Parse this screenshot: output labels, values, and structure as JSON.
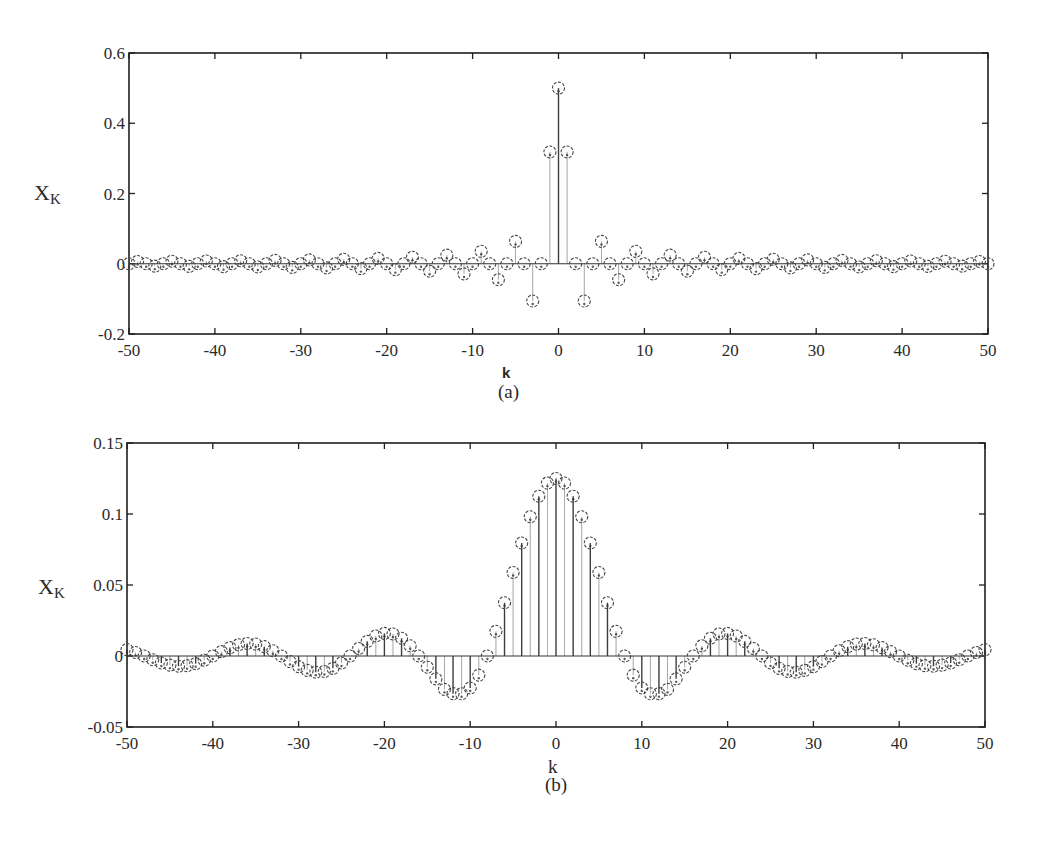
{
  "chart_data": [
    {
      "id": "a",
      "type": "stem",
      "caption": "(a)",
      "title": "",
      "xlabel": "k",
      "ylabel": "X",
      "ylabel_sub": "K",
      "xlim": [
        -50,
        50
      ],
      "ylim": [
        -0.2,
        0.6
      ],
      "xticks": [
        -50,
        -40,
        -30,
        -20,
        -10,
        0,
        10,
        20,
        30,
        40,
        50
      ],
      "xtick_labels": [
        "-50",
        "-40",
        "-30",
        "-20",
        "-10",
        "0",
        "10",
        "20",
        "30",
        "40",
        "50"
      ],
      "yticks": [
        -0.2,
        0,
        0.2,
        0.4,
        0.6
      ],
      "ytick_labels": [
        "-0.2",
        "0",
        "0.2",
        "0.4",
        "0.6"
      ],
      "grid": false,
      "legend": null,
      "marker": "circle",
      "x": [
        -50,
        -49,
        -48,
        -47,
        -46,
        -45,
        -44,
        -43,
        -42,
        -41,
        -40,
        -39,
        -38,
        -37,
        -36,
        -35,
        -34,
        -33,
        -32,
        -31,
        -30,
        -29,
        -28,
        -27,
        -26,
        -25,
        -24,
        -23,
        -22,
        -21,
        -20,
        -19,
        -18,
        -17,
        -16,
        -15,
        -14,
        -13,
        -12,
        -11,
        -10,
        -9,
        -8,
        -7,
        -6,
        -5,
        -4,
        -3,
        -2,
        -1,
        0,
        1,
        2,
        3,
        4,
        5,
        6,
        7,
        8,
        9,
        10,
        11,
        12,
        13,
        14,
        15,
        16,
        17,
        18,
        19,
        20,
        21,
        22,
        23,
        24,
        25,
        26,
        27,
        28,
        29,
        30,
        31,
        32,
        33,
        34,
        35,
        36,
        37,
        38,
        39,
        40,
        41,
        42,
        43,
        44,
        45,
        46,
        47,
        48,
        49,
        50
      ],
      "values": [
        0,
        0.0065,
        0,
        -0.0068,
        0,
        0.0071,
        0,
        -0.0074,
        0,
        0.0078,
        0,
        -0.0082,
        0,
        0.0086,
        0,
        -0.0091,
        0,
        0.0096,
        0,
        -0.0103,
        0,
        0.011,
        0,
        -0.0118,
        0,
        0.0127,
        0,
        -0.0138,
        0,
        0.0152,
        0,
        -0.0168,
        0,
        0.0187,
        0,
        -0.0212,
        0,
        0.0245,
        0,
        -0.0289,
        0,
        0.0354,
        0,
        -0.0455,
        0,
        0.0637,
        0,
        -0.1061,
        0,
        0.3183,
        0.5,
        0.3183,
        0,
        -0.1061,
        0,
        0.0637,
        0,
        -0.0455,
        0,
        0.0354,
        0,
        -0.0289,
        0,
        0.0245,
        0,
        -0.0212,
        0,
        0.0187,
        0,
        -0.0168,
        0,
        0.0152,
        0,
        -0.0138,
        0,
        0.0127,
        0,
        -0.0118,
        0,
        0.011,
        0,
        -0.0103,
        0,
        0.0096,
        0,
        -0.0091,
        0,
        0.0086,
        0,
        -0.0082,
        0,
        0.0078,
        0,
        -0.0074,
        0,
        0.0071,
        0,
        -0.0068,
        0,
        0.0065,
        0
      ]
    },
    {
      "id": "b",
      "type": "stem",
      "caption": "(b)",
      "title": "",
      "xlabel": "k",
      "ylabel": "X",
      "ylabel_sub": "K",
      "xlim": [
        -50,
        50
      ],
      "ylim": [
        -0.05,
        0.15
      ],
      "xticks": [
        -50,
        -40,
        -30,
        -20,
        -10,
        0,
        10,
        20,
        30,
        40,
        50
      ],
      "xtick_labels": [
        "-50",
        "-40",
        "-30",
        "-20",
        "-10",
        "0",
        "10",
        "20",
        "30",
        "40",
        "50"
      ],
      "yticks": [
        -0.05,
        0,
        0.05,
        0.1,
        0.15
      ],
      "ytick_labels": [
        "-0.05",
        "0",
        "0.05",
        "0.1",
        "0.15"
      ],
      "grid": false,
      "legend": null,
      "marker": "circle",
      "x": [
        -50,
        -49,
        -48,
        -47,
        -46,
        -45,
        -44,
        -43,
        -42,
        -41,
        -40,
        -39,
        -38,
        -37,
        -36,
        -35,
        -34,
        -33,
        -32,
        -31,
        -30,
        -29,
        -28,
        -27,
        -26,
        -25,
        -24,
        -23,
        -22,
        -21,
        -20,
        -19,
        -18,
        -17,
        -16,
        -15,
        -14,
        -13,
        -12,
        -11,
        -10,
        -9,
        -8,
        -7,
        -6,
        -5,
        -4,
        -3,
        -2,
        -1,
        0,
        1,
        2,
        3,
        4,
        5,
        6,
        7,
        8,
        9,
        10,
        11,
        12,
        13,
        14,
        15,
        16,
        17,
        18,
        19,
        20,
        21,
        22,
        23,
        24,
        25,
        26,
        27,
        28,
        29,
        30,
        31,
        32,
        33,
        34,
        35,
        36,
        37,
        38,
        39,
        40,
        41,
        42,
        43,
        44,
        45,
        46,
        47,
        48,
        49,
        50
      ],
      "values": [
        0.0045,
        0.0025,
        0,
        -0.0026,
        -0.0049,
        -0.0064,
        -0.0072,
        -0.0068,
        -0.0054,
        -0.003,
        0,
        0.0031,
        0.0059,
        0.0079,
        0.0088,
        0.0084,
        0.0066,
        0.0037,
        0,
        -0.0039,
        -0.0075,
        -0.0101,
        -0.0114,
        -0.0109,
        -0.0087,
        -0.0049,
        0,
        0.0053,
        0.0103,
        0.0141,
        0.0159,
        0.0155,
        0.0125,
        0.0072,
        0,
        -0.0079,
        -0.0161,
        -0.0235,
        -0.0265,
        -0.0266,
        -0.0225,
        -0.0135,
        0,
        0.0174,
        0.0375,
        0.0588,
        0.0796,
        0.0981,
        0.1125,
        0.1218,
        0.125,
        0.1218,
        0.1125,
        0.0981,
        0.0796,
        0.0588,
        0.0375,
        0.0174,
        0,
        -0.0135,
        -0.0225,
        -0.0266,
        -0.0265,
        -0.0235,
        -0.0161,
        -0.0079,
        0,
        0.0072,
        0.0125,
        0.0155,
        0.0159,
        0.0141,
        0.0103,
        0.0053,
        0,
        -0.0049,
        -0.0087,
        -0.0109,
        -0.0114,
        -0.0101,
        -0.0075,
        -0.0039,
        0,
        0.0037,
        0.0066,
        0.0084,
        0.0088,
        0.0079,
        0.0059,
        0.0031,
        0,
        -0.003,
        -0.0054,
        -0.0068,
        -0.0072,
        -0.0064,
        -0.0049,
        -0.0026,
        0,
        0.0025,
        0.0045
      ]
    }
  ],
  "colors": {
    "axis": "#1e1e1e",
    "stem": "#333333",
    "marker": "#444444",
    "text": "#2a2a2a"
  }
}
